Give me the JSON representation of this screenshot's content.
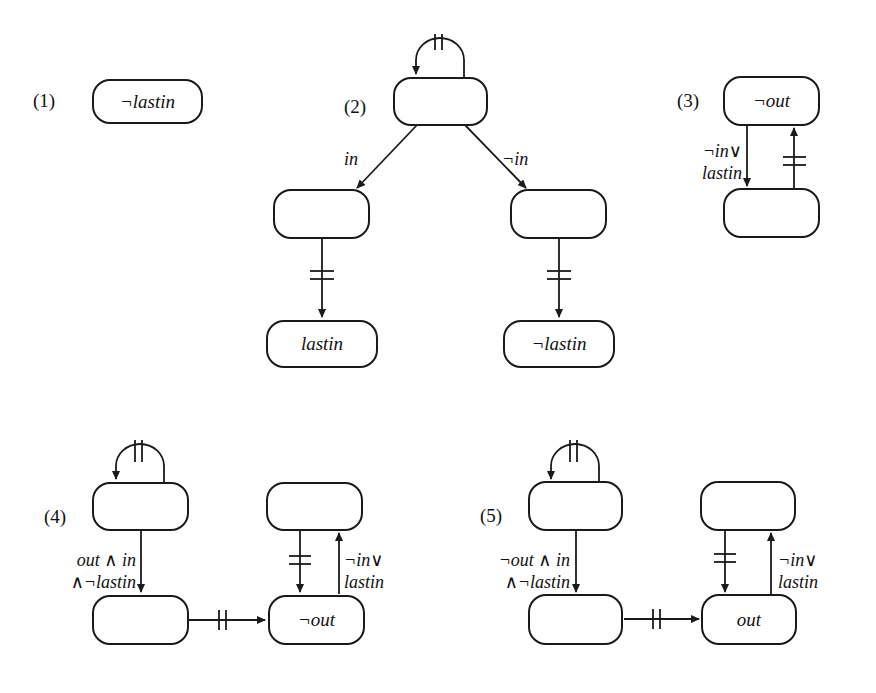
{
  "diagrams": [
    {
      "id": "1",
      "label": "(1)",
      "states": [
        {
          "text": "¬lastin"
        }
      ]
    },
    {
      "id": "2",
      "label": "(2)",
      "states": [
        {
          "text": ""
        },
        {
          "text": ""
        },
        {
          "text": ""
        },
        {
          "text": "lastin"
        },
        {
          "text": "¬lastin"
        }
      ],
      "transitions": [
        {
          "from": 0,
          "to": 0,
          "label": "",
          "marker": "||"
        },
        {
          "from": 0,
          "to": 1,
          "label": "in"
        },
        {
          "from": 0,
          "to": 2,
          "label": "¬in"
        },
        {
          "from": 1,
          "to": 3,
          "label": "",
          "marker": "="
        },
        {
          "from": 2,
          "to": 4,
          "label": "",
          "marker": "="
        }
      ]
    },
    {
      "id": "3",
      "label": "(3)",
      "states": [
        {
          "text": "¬out"
        },
        {
          "text": ""
        }
      ],
      "transitions": [
        {
          "from": 0,
          "to": 1,
          "label_line1": "¬in∨",
          "label_line2": "lastin"
        },
        {
          "from": 1,
          "to": 0,
          "label": "",
          "marker": "="
        }
      ]
    },
    {
      "id": "4",
      "label": "(4)",
      "states": [
        {
          "text": ""
        },
        {
          "text": ""
        },
        {
          "text": ""
        },
        {
          "text": "¬out"
        }
      ],
      "transitions": [
        {
          "from": 0,
          "to": 0,
          "label": "",
          "marker": "||"
        },
        {
          "from": 0,
          "to": 1,
          "label_line1": "out ∧ in",
          "label_line2": "∧¬lastin"
        },
        {
          "from": 1,
          "to": 3,
          "label": "",
          "marker": "||"
        },
        {
          "from": 2,
          "to": 3,
          "label": "",
          "marker": "="
        },
        {
          "from": 3,
          "to": 2,
          "label_line1": "¬in∨",
          "label_line2": "lastin"
        }
      ]
    },
    {
      "id": "5",
      "label": "(5)",
      "states": [
        {
          "text": ""
        },
        {
          "text": ""
        },
        {
          "text": ""
        },
        {
          "text": "out"
        }
      ],
      "transitions": [
        {
          "from": 0,
          "to": 0,
          "label": "",
          "marker": "||"
        },
        {
          "from": 0,
          "to": 1,
          "label_line1": "¬out ∧ in",
          "label_line2": "∧¬lastin"
        },
        {
          "from": 1,
          "to": 3,
          "label": "",
          "marker": "||"
        },
        {
          "from": 2,
          "to": 3,
          "label": "",
          "marker": "="
        },
        {
          "from": 3,
          "to": 2,
          "label_line1": "¬in∨",
          "label_line2": "lastin"
        }
      ]
    }
  ]
}
